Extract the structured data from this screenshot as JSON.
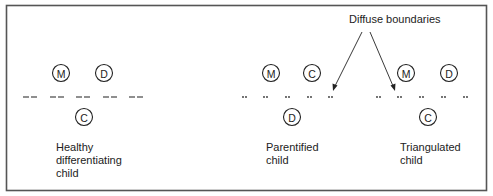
{
  "diagram": {
    "type": "family-boundary-diagram",
    "annotation": {
      "label": "Diffuse boundaries",
      "arrow_count": 2
    },
    "panels": [
      {
        "id": "healthy",
        "caption_lines": [
          "Healthy",
          "differentiating",
          "child"
        ],
        "top_nodes": [
          "M",
          "D"
        ],
        "bottom_node": "C",
        "boundary_style": "dashed"
      },
      {
        "id": "parentified",
        "caption_lines": [
          "Parentified",
          "child"
        ],
        "top_nodes": [
          "M",
          "C"
        ],
        "bottom_node": "D",
        "boundary_style": "dotted"
      },
      {
        "id": "triangulated",
        "caption_lines": [
          "Triangulated",
          "child"
        ],
        "top_nodes": [
          "M",
          "D"
        ],
        "bottom_node": "C",
        "boundary_style": "dotted"
      }
    ],
    "colors": {
      "frame": "#555555",
      "ink": "#222222",
      "background": "#ffffff"
    }
  }
}
